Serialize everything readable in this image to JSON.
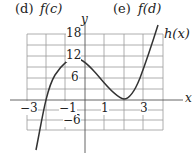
{
  "options": [
    {
      "letter": "(d)",
      "expr": "f(c)"
    },
    {
      "letter": "(e)",
      "expr": "f(d)"
    }
  ],
  "graph": {
    "function_label": "h(x)",
    "x_axis_label": "x",
    "y_axis_label": "y",
    "x_ticks": [
      "−3",
      "−1",
      "1",
      "3"
    ],
    "y_ticks": [
      "18",
      "12",
      "6",
      "−6"
    ],
    "curve_color": "#333333",
    "grid_color": "#9a9a9a"
  }
}
